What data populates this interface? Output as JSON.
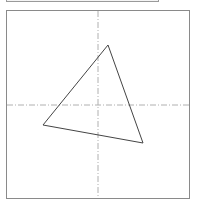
{
  "canvas": {
    "border_color": "#8a8a8a",
    "axis_color": "#b0b0b0",
    "shape_color": "#444444",
    "axes": {
      "vertical_x": 98,
      "horizontal_y": 105
    },
    "triangle": {
      "points": "108,45 143,143 43,125"
    }
  }
}
